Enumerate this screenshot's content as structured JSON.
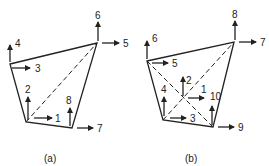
{
  "diagram_a": {
    "caption": "(a)",
    "labels": [
      "1",
      "2",
      "3",
      "4",
      "5",
      "6",
      "7",
      "8"
    ]
  },
  "diagram_b": {
    "caption": "(b)",
    "labels": [
      "1",
      "2",
      "3",
      "4",
      "5",
      "6",
      "7",
      "8",
      "9",
      "10"
    ]
  },
  "colors": {
    "line": "#222222",
    "background": "#ffffff"
  }
}
